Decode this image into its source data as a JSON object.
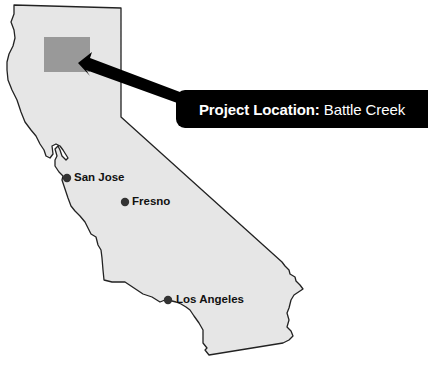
{
  "map": {
    "title": "California",
    "colors": {
      "land": "#e6e6e6",
      "outline": "#222222",
      "project_area": "#999999",
      "arrow": "#000000",
      "city_dot": "#333333"
    },
    "project_area": {
      "x": 44,
      "y": 37,
      "width": 46,
      "height": 35
    },
    "callout": {
      "label": "Project Location:",
      "value": "Battle Creek"
    },
    "cities": [
      {
        "name": "San Jose",
        "x": 67,
        "y": 178
      },
      {
        "name": "Fresno",
        "x": 125,
        "y": 202
      },
      {
        "name": "Los Angeles",
        "x": 168,
        "y": 300
      }
    ]
  }
}
